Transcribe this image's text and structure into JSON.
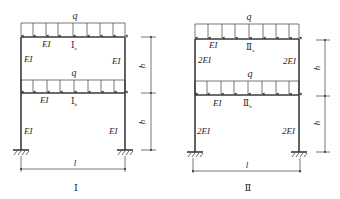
{
  "load_label": "q",
  "dimension_labels": {
    "height": "h",
    "span": "l"
  },
  "frames": [
    {
      "id": "I",
      "caption": "Ⅰ",
      "upper_story": {
        "label_main": "Ⅰ",
        "label_sub": "a",
        "beam": "EI",
        "left_column": "EI",
        "right_column": "EI"
      },
      "lower_story": {
        "label_main": "Ⅰ",
        "label_sub": "b",
        "beam": "EI",
        "left_column": "EI",
        "right_column": "EI"
      }
    },
    {
      "id": "II",
      "caption": "Ⅱ",
      "upper_story": {
        "label_main": "Ⅱ",
        "label_sub": "a",
        "beam": "EI",
        "left_column": "2EI",
        "right_column": "2EI"
      },
      "lower_story": {
        "label_main": "Ⅱ",
        "label_sub": "b",
        "beam": "EI",
        "left_column": "2EI",
        "right_column": "2EI"
      }
    }
  ]
}
